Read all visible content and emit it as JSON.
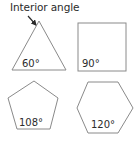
{
  "title": "Interior angle",
  "shapes": [
    {
      "name": "triangle",
      "angle_label": "60°"
    },
    {
      "name": "square",
      "angle_label": "90°"
    },
    {
      "name": "pentagon",
      "angle_label": "108°"
    },
    {
      "name": "hexagon",
      "angle_label": "120°"
    }
  ],
  "colors": {
    "stroke": "#8a8a8a",
    "text": "#2b2b2b",
    "arrow": "#2b2b2b"
  }
}
